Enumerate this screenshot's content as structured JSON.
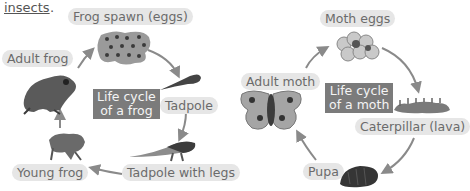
{
  "intro_text": "insects",
  "intro_punct": ".",
  "frog_cycle": {
    "title_line1": "Life cycle",
    "title_line2": "of a frog",
    "stages": [
      {
        "label": "Frog spawn (eggs)"
      },
      {
        "label": "Tadpole"
      },
      {
        "label": "Tadpole with legs"
      },
      {
        "label": "Young frog"
      },
      {
        "label": "Adult frog"
      }
    ]
  },
  "moth_cycle": {
    "title_line1": "Life cycle",
    "title_line2": "of a moth",
    "stages": [
      {
        "label": "Moth eggs"
      },
      {
        "label": "Caterpillar (lava)"
      },
      {
        "label": "Pupa"
      },
      {
        "label": "Adult moth"
      }
    ]
  }
}
